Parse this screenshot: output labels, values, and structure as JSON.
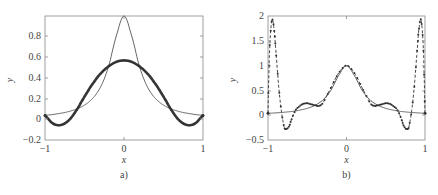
{
  "chart_data": [
    {
      "panel": "a)",
      "type": "line",
      "title": "",
      "xlabel": "x",
      "ylabel": "y",
      "xlim": [
        -1,
        1
      ],
      "ylim": [
        -0.2,
        1.0
      ],
      "xticks": [
        -1,
        0,
        1
      ],
      "xtick_labels": [
        "−1",
        "0",
        "1"
      ],
      "yticks": [
        -0.2,
        0,
        0.2,
        0.4,
        0.6,
        0.8
      ],
      "ytick_labels": [
        "−0.2",
        "0",
        "0.2",
        "0.4",
        "0.6",
        "0.8"
      ],
      "grid": false,
      "legend": null,
      "series": [
        {
          "name": "f(x) = 1/(1+25x^2)",
          "style": "thin solid",
          "x": [
            -1,
            -0.9,
            -0.8,
            -0.7,
            -0.6,
            -0.5,
            -0.4,
            -0.3,
            -0.2,
            -0.1,
            0,
            0.1,
            0.2,
            0.3,
            0.4,
            0.5,
            0.6,
            0.7,
            0.8,
            0.9,
            1
          ],
          "y": [
            0.038,
            0.047,
            0.059,
            0.075,
            0.1,
            0.138,
            0.2,
            0.308,
            0.5,
            0.8,
            1.0,
            0.8,
            0.5,
            0.308,
            0.2,
            0.138,
            0.1,
            0.075,
            0.059,
            0.047,
            0.038
          ]
        },
        {
          "name": "approximation",
          "style": "thick solid with dense markers",
          "x": [
            -1,
            -0.9,
            -0.8,
            -0.7,
            -0.6,
            -0.5,
            -0.4,
            -0.3,
            -0.2,
            -0.1,
            0,
            0.1,
            0.2,
            0.3,
            0.4,
            0.5,
            0.6,
            0.7,
            0.8,
            0.9,
            1
          ],
          "y": [
            0.04,
            -0.04,
            -0.055,
            -0.01,
            0.09,
            0.22,
            0.34,
            0.44,
            0.51,
            0.555,
            0.57,
            0.555,
            0.51,
            0.44,
            0.34,
            0.22,
            0.09,
            -0.01,
            -0.055,
            -0.04,
            0.04
          ]
        }
      ]
    },
    {
      "panel": "b)",
      "type": "line",
      "title": "",
      "xlabel": "x",
      "ylabel": "y",
      "xlim": [
        -1,
        1
      ],
      "ylim": [
        -0.5,
        2.0
      ],
      "xticks": [
        -1,
        0,
        1
      ],
      "xtick_labels": [
        "−1",
        "0",
        "1"
      ],
      "yticks": [
        -0.5,
        0,
        0.5,
        1,
        1.5,
        2
      ],
      "ytick_labels": [
        "−0.5",
        "0",
        "0.5",
        "1",
        "1.5",
        "2"
      ],
      "grid": false,
      "legend": null,
      "series": [
        {
          "name": "f(x) = 1/(1+25x^2)",
          "style": "thin solid",
          "x": [
            -1,
            -0.9,
            -0.8,
            -0.7,
            -0.6,
            -0.5,
            -0.4,
            -0.3,
            -0.2,
            -0.1,
            0,
            0.1,
            0.2,
            0.3,
            0.4,
            0.5,
            0.6,
            0.7,
            0.8,
            0.9,
            1
          ],
          "y": [
            0.038,
            0.047,
            0.059,
            0.075,
            0.1,
            0.138,
            0.2,
            0.308,
            0.5,
            0.8,
            1.0,
            0.8,
            0.5,
            0.308,
            0.2,
            0.138,
            0.1,
            0.075,
            0.059,
            0.047,
            0.038
          ]
        },
        {
          "name": "interpolating polynomial",
          "style": "dashed with markers",
          "x": [
            -1,
            -0.98,
            -0.95,
            -0.92,
            -0.9,
            -0.85,
            -0.8,
            -0.77,
            -0.73,
            -0.7,
            -0.65,
            -0.6,
            -0.55,
            -0.5,
            -0.45,
            -0.4,
            -0.35,
            -0.3,
            -0.2,
            -0.1,
            0,
            0.1,
            0.2,
            0.3,
            0.35,
            0.4,
            0.45,
            0.5,
            0.55,
            0.6,
            0.65,
            0.7,
            0.73,
            0.77,
            0.8,
            0.85,
            0.9,
            0.92,
            0.95,
            0.98,
            1
          ],
          "y": [
            0.04,
            1.3,
            1.92,
            1.7,
            1.3,
            0.35,
            -0.2,
            -0.28,
            -0.22,
            -0.08,
            0.1,
            0.18,
            0.23,
            0.24,
            0.22,
            0.2,
            0.19,
            0.25,
            0.55,
            0.85,
            1.0,
            0.85,
            0.55,
            0.25,
            0.19,
            0.2,
            0.22,
            0.24,
            0.23,
            0.18,
            0.1,
            -0.08,
            -0.22,
            -0.28,
            -0.2,
            0.35,
            1.3,
            1.7,
            1.92,
            1.3,
            0.04
          ]
        }
      ]
    }
  ],
  "panels": {
    "a": {
      "label": "a)",
      "xlabel": "x",
      "ylabel": "y",
      "xt0": "−1",
      "xt1": "0",
      "xt2": "1",
      "yt0": "−0.2",
      "yt1": "0",
      "yt2": "0.2",
      "yt3": "0.4",
      "yt4": "0.6",
      "yt5": "0.8"
    },
    "b": {
      "label": "b)",
      "xlabel": "x",
      "ylabel": "y",
      "xt0": "−1",
      "xt1": "0",
      "xt2": "1",
      "yt0": "−0.5",
      "yt1": "0",
      "yt2": "0.5",
      "yt3": "1",
      "yt4": "1.5",
      "yt5": "2"
    }
  }
}
